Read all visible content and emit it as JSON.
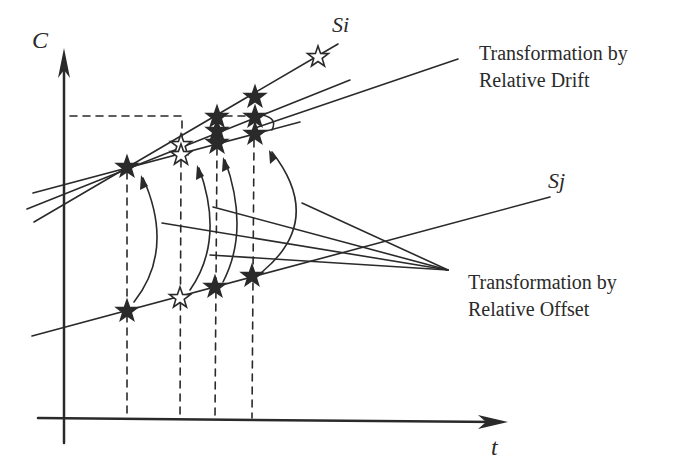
{
  "axes": {
    "y_label": "C",
    "x_label": "t"
  },
  "series": {
    "si_label": "Si",
    "sj_label": "Sj"
  },
  "annotations": {
    "drift_line1": "Transformation by",
    "drift_line2": "Relative Drift",
    "offset_line1": "Transformation by",
    "offset_line2": "Relative Offset"
  },
  "colors": {
    "ink": "#2a2a2a",
    "background": "#ffffff"
  },
  "markers": {
    "sj_points": [
      {
        "x": 127,
        "y": 311,
        "style": "filled"
      },
      {
        "x": 180,
        "y": 298,
        "style": "hollow"
      },
      {
        "x": 215,
        "y": 287,
        "style": "filled"
      },
      {
        "x": 252,
        "y": 276,
        "style": "filled"
      }
    ],
    "si_points": [
      {
        "x": 127,
        "y": 167,
        "style": "filled"
      },
      {
        "x": 181,
        "y": 145,
        "style": "hollow"
      },
      {
        "x": 181,
        "y": 155,
        "style": "hollow"
      },
      {
        "x": 217,
        "y": 117,
        "style": "filled"
      },
      {
        "x": 217,
        "y": 131,
        "style": "filled"
      },
      {
        "x": 217,
        "y": 143,
        "style": "filled"
      },
      {
        "x": 255,
        "y": 97,
        "style": "filled"
      },
      {
        "x": 255,
        "y": 117,
        "style": "filled"
      },
      {
        "x": 255,
        "y": 134,
        "style": "filled"
      },
      {
        "x": 318,
        "y": 57,
        "style": "hollow"
      }
    ]
  }
}
